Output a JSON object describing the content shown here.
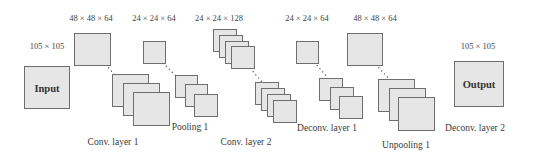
{
  "diagram": {
    "input": {
      "label": "Input",
      "size": "105 × 105"
    },
    "output": {
      "label": "Output",
      "size": "105 × 105"
    },
    "layers": [
      {
        "name": "Conv. layer 1",
        "dims": "48 × 48 × 64",
        "feature_maps_shown": 3
      },
      {
        "name": "Pooling 1",
        "dims": "24 × 24 × 64",
        "feature_maps_shown": 3
      },
      {
        "name": "Conv. layer 2",
        "dims": "24 × 24 × 128",
        "feature_maps_shown": 4
      },
      {
        "name": "Deconv. layer 1",
        "dims": "24 × 24 × 64",
        "feature_maps_shown": 3
      },
      {
        "name": "Unpooling 1",
        "dims": "48 × 48 × 64",
        "feature_maps_shown": 3
      },
      {
        "name": "Deconv. layer 2",
        "dims": "",
        "feature_maps_shown": 0
      }
    ],
    "colors": {
      "box_fill": "#e6e6e6",
      "box_border": "#6e6e6e",
      "text": "#333333",
      "connector": "#555555"
    }
  }
}
